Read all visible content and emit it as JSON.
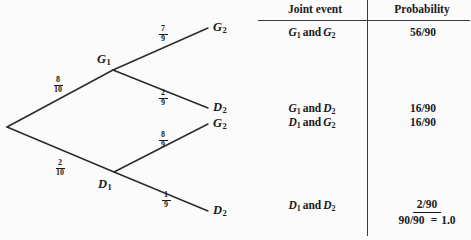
{
  "diagram": {
    "type": "probability-tree",
    "root": {
      "x": 7,
      "y": 127
    },
    "nodes": [
      {
        "id": "G1",
        "label": "G",
        "sub": "1",
        "x": 113,
        "y": 70,
        "label_x": 97,
        "label_y": 53
      },
      {
        "id": "D1",
        "label": "D",
        "sub": "1",
        "x": 114,
        "y": 172,
        "label_x": 98,
        "label_y": 178
      },
      {
        "id": "G2a",
        "label": "G",
        "sub": "2",
        "x": 208,
        "y": 28,
        "label_x": 213,
        "label_y": 21
      },
      {
        "id": "D2a",
        "label": "D",
        "sub": "2",
        "x": 208,
        "y": 108,
        "label_x": 213,
        "label_y": 100
      },
      {
        "id": "G2b",
        "label": "G",
        "sub": "2",
        "x": 208,
        "y": 124,
        "label_x": 213,
        "label_y": 116
      },
      {
        "id": "D2b",
        "label": "D",
        "sub": "2",
        "x": 208,
        "y": 211,
        "label_x": 213,
        "label_y": 203
      }
    ],
    "branches": [
      {
        "id": "root-G1",
        "from": "root",
        "to": "G1",
        "num": "8",
        "den": "10",
        "label_x": 50,
        "label_y": 76
      },
      {
        "id": "root-D1",
        "from": "root",
        "to": "D1",
        "num": "2",
        "den": "10",
        "label_x": 52,
        "label_y": 159
      },
      {
        "id": "G1-G2",
        "from": "G1",
        "to": "G2a",
        "num": "7",
        "den": "9",
        "label_x": 155,
        "label_y": 25
      },
      {
        "id": "G1-D2",
        "from": "G1",
        "to": "D2a",
        "num": "2",
        "den": "9",
        "label_x": 155,
        "label_y": 89
      },
      {
        "id": "D1-G2",
        "from": "D1",
        "to": "G2b",
        "num": "8",
        "den": "9",
        "label_x": 155,
        "label_y": 131
      },
      {
        "id": "D1-D2",
        "from": "D1",
        "to": "D2b",
        "num": "1",
        "den": "9",
        "label_x": 158,
        "label_y": 191
      }
    ],
    "line_color": "#2b2b2b"
  },
  "table": {
    "headers": {
      "event": "Joint event",
      "probability": "Probability"
    },
    "rows": [
      {
        "event_first": "G",
        "event_first_sub": "1",
        "conjunction": "and",
        "event_second": "G",
        "event_second_sub": "2",
        "probability": "56/90",
        "y": 26
      },
      {
        "event_first": "G",
        "event_first_sub": "1",
        "conjunction": "and",
        "event_second": "D",
        "event_second_sub": "2",
        "probability": "16/90",
        "y": 102
      },
      {
        "event_first": "D",
        "event_first_sub": "1",
        "conjunction": "and",
        "event_second": "G",
        "event_second_sub": "2",
        "probability": "16/90",
        "y": 116
      },
      {
        "event_first": "D",
        "event_first_sub": "1",
        "conjunction": "and",
        "event_second": "D",
        "event_second_sub": "2",
        "probability": "",
        "y": 199
      }
    ],
    "sum": {
      "last_term": "2/90",
      "total": "90/90",
      "equals": "=",
      "value": "1.0"
    }
  }
}
